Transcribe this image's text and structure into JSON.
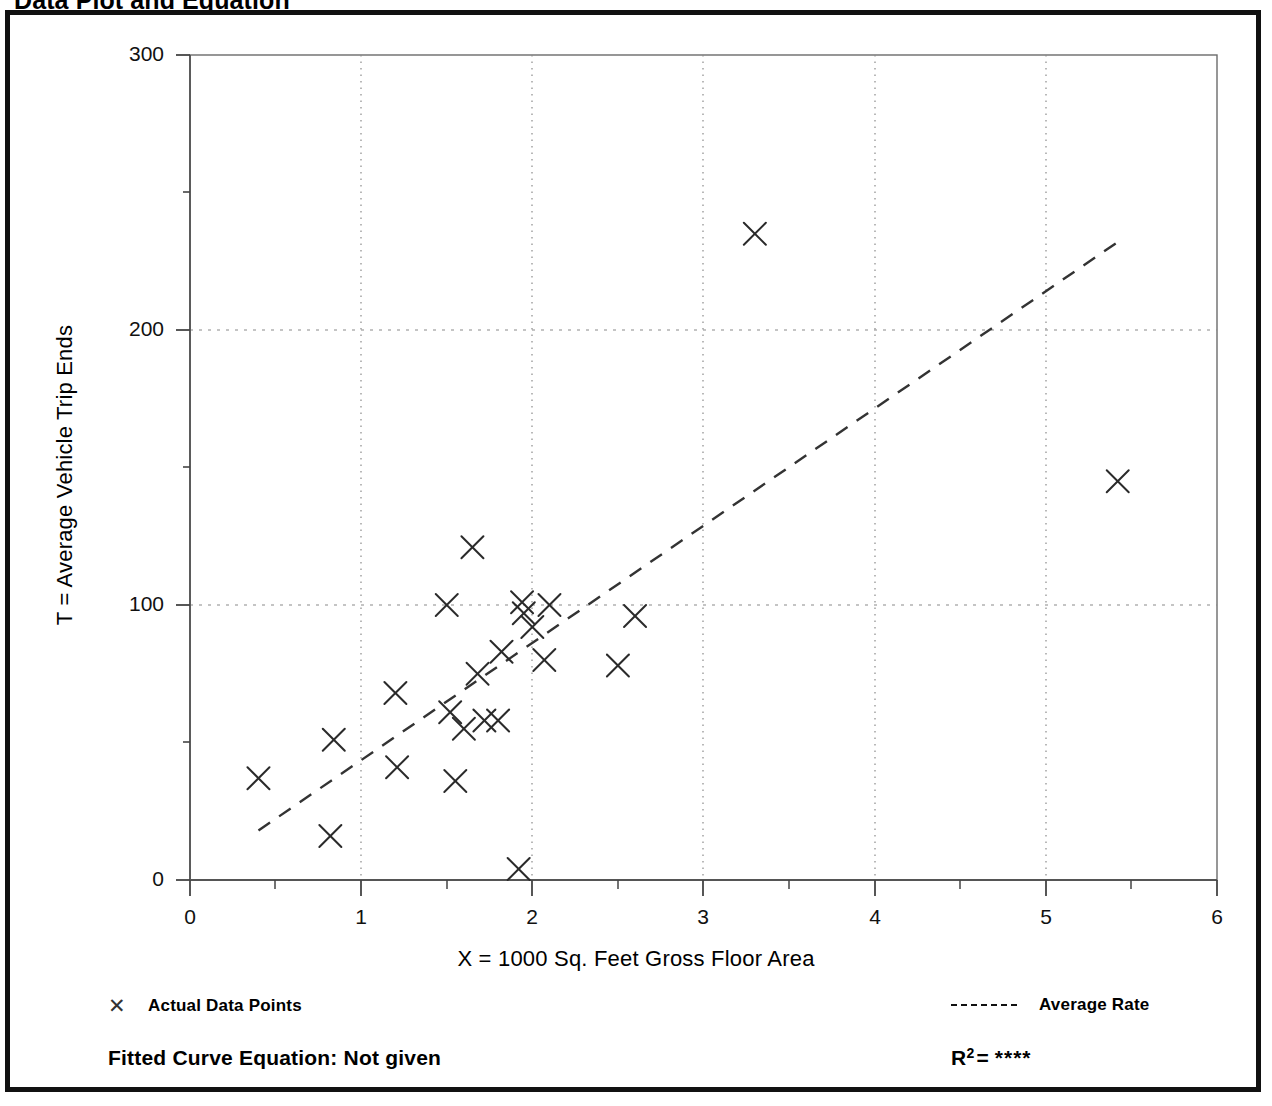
{
  "page": {
    "title": "Data Plot and Equation"
  },
  "legend": {
    "points_marker": "✕",
    "points_label": "Actual Data Points",
    "rate_label": "Average Rate"
  },
  "equation": {
    "label": "Fitted Curve Equation:  Not given",
    "r2_symbol": "R",
    "r2_exponent": "2",
    "r2_equals": "=",
    "r2_value": "****"
  },
  "chart_data": {
    "type": "scatter",
    "title": "Data Plot and Equation",
    "xlabel": "X = 1000 Sq. Feet Gross Floor Area",
    "ylabel": "T = Average Vehicle Trip Ends",
    "xlim": [
      0,
      6
    ],
    "ylim": [
      0,
      300
    ],
    "xticks": [
      0,
      1,
      2,
      3,
      4,
      5,
      6
    ],
    "xtick_labels": [
      "0",
      "1",
      "2",
      "3",
      "4",
      "5",
      "6"
    ],
    "yticks": [
      0,
      100,
      200,
      300
    ],
    "ytick_labels": [
      "0",
      "100",
      "200",
      "300"
    ],
    "y_minor_ticks": [
      50,
      150,
      250
    ],
    "grid": "dotted gridlines at x = 1,2,3,4,5 and y = 100,200",
    "legend_position": "below-plot",
    "series": [
      {
        "name": "Actual Data Points",
        "marker": "x",
        "points": [
          [
            0.4,
            37
          ],
          [
            0.82,
            16
          ],
          [
            0.84,
            51
          ],
          [
            1.2,
            68
          ],
          [
            1.21,
            41
          ],
          [
            1.5,
            100
          ],
          [
            1.52,
            61
          ],
          [
            1.55,
            36
          ],
          [
            1.6,
            55
          ],
          [
            1.65,
            121
          ],
          [
            1.68,
            75
          ],
          [
            1.72,
            58
          ],
          [
            1.8,
            58
          ],
          [
            1.82,
            83
          ],
          [
            1.92,
            4
          ],
          [
            1.94,
            101
          ],
          [
            1.95,
            97
          ],
          [
            2.0,
            92
          ],
          [
            2.07,
            80
          ],
          [
            2.1,
            100
          ],
          [
            2.5,
            78
          ],
          [
            2.6,
            96
          ],
          [
            3.3,
            235
          ],
          [
            5.42,
            145
          ]
        ]
      },
      {
        "name": "Average Rate",
        "type": "line",
        "style": "dashed",
        "endpoints": [
          [
            0.4,
            18
          ],
          [
            5.42,
            232
          ]
        ]
      }
    ]
  }
}
